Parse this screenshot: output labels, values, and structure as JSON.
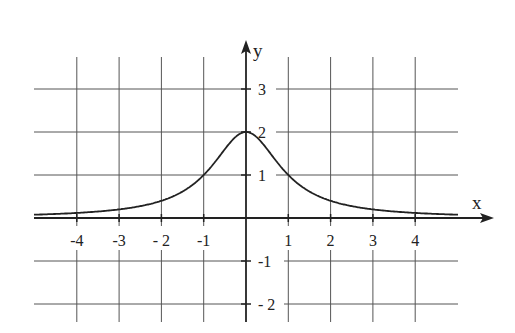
{
  "chart_data": {
    "type": "line",
    "title": "",
    "function": "2/(1+x^2)",
    "xlabel": "x",
    "ylabel": "y",
    "xlim": [
      -4.9,
      5.1
    ],
    "ylim": [
      -2.4,
      3.7
    ],
    "x_ticks": [
      -4,
      -3,
      -2,
      -1,
      1,
      2,
      3,
      4
    ],
    "x_tick_labels": [
      "-4",
      "-3",
      "- 2",
      "-1",
      "1",
      "2",
      "3",
      "4"
    ],
    "y_ticks": [
      3,
      2,
      1,
      -1,
      -2
    ],
    "y_tick_labels": [
      "3",
      "2",
      "1",
      "-1",
      "- 2"
    ],
    "grid": true,
    "series": [
      {
        "name": "f(x)",
        "x": [
          -5,
          -4,
          -3,
          -2,
          -1,
          0,
          1,
          2,
          3,
          4,
          5
        ],
        "values": [
          0.077,
          0.118,
          0.2,
          0.4,
          1.0,
          2.0,
          1.0,
          0.4,
          0.2,
          0.118,
          0.077
        ]
      }
    ],
    "line_color": "#222222",
    "grid_color": "#555555"
  }
}
